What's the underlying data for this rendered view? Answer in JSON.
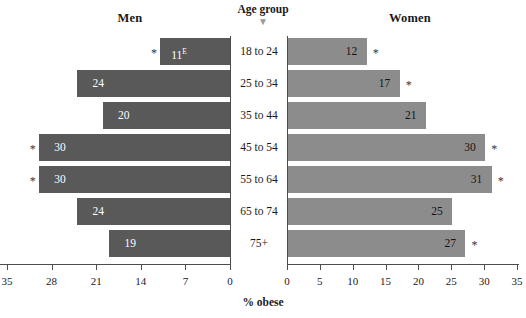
{
  "chart_data": {
    "type": "bar",
    "subtype": "population-pyramid",
    "title": "",
    "xlabel": "% obese",
    "ylabel": "Age group",
    "categories": [
      "18 to 24",
      "25 to 34",
      "35 to 44",
      "45 to 54",
      "55 to 64",
      "65 to 74",
      "75+"
    ],
    "series": [
      {
        "name": "Men",
        "side": "left",
        "color": "#595959",
        "values": [
          11,
          24,
          20,
          30,
          30,
          24,
          19
        ],
        "labels": [
          "11",
          "24",
          "20",
          "30",
          "30",
          "24",
          "19"
        ],
        "label_superscripts": [
          "E",
          "",
          "",
          "",
          "",
          "",
          ""
        ],
        "significance_marks": [
          "*",
          "",
          "",
          "*",
          "*",
          "",
          ""
        ],
        "axis": {
          "min": 0,
          "max": 35,
          "reversed": true,
          "ticks": [
            35,
            28,
            21,
            14,
            7,
            0
          ]
        }
      },
      {
        "name": "Women",
        "side": "right",
        "color": "#8c8c8c",
        "values": [
          12,
          17,
          21,
          30,
          31,
          25,
          27
        ],
        "labels": [
          "12",
          "17",
          "21",
          "30",
          "31",
          "25",
          "27"
        ],
        "label_superscripts": [
          "",
          "",
          "",
          "",
          "",
          "",
          ""
        ],
        "significance_marks": [
          "*",
          "*",
          "",
          "*",
          "*",
          "",
          "*"
        ],
        "axis": {
          "min": 0,
          "max": 35,
          "reversed": false,
          "ticks": [
            0,
            5,
            10,
            15,
            20,
            25,
            30,
            35
          ]
        }
      }
    ],
    "grid": false,
    "legend": "none"
  },
  "headers": {
    "men": "Men",
    "women": "Women",
    "age_group": "Age group",
    "age_group_caret": "▼"
  },
  "axis": {
    "caption": "% obese",
    "left_ticks": [
      "35",
      "28",
      "21",
      "14",
      "7",
      "0"
    ],
    "right_ticks": [
      "0",
      "5",
      "10",
      "15",
      "20",
      "25",
      "30",
      "35"
    ]
  },
  "ages": [
    "18 to 24",
    "25 to 34",
    "35 to 44",
    "45 to 54",
    "55 to 64",
    "65 to 74",
    "75+"
  ],
  "men_rows": [
    {
      "label": "11",
      "sup": "E",
      "star": "*"
    },
    {
      "label": "24",
      "sup": "",
      "star": ""
    },
    {
      "label": "20",
      "sup": "",
      "star": ""
    },
    {
      "label": "30",
      "sup": "",
      "star": "*"
    },
    {
      "label": "30",
      "sup": "",
      "star": "*"
    },
    {
      "label": "24",
      "sup": "",
      "star": ""
    },
    {
      "label": "19",
      "sup": "",
      "star": ""
    }
  ],
  "women_rows": [
    {
      "label": "12",
      "sup": "",
      "star": "*"
    },
    {
      "label": "17",
      "sup": "",
      "star": "*"
    },
    {
      "label": "21",
      "sup": "",
      "star": ""
    },
    {
      "label": "30",
      "sup": "",
      "star": "*"
    },
    {
      "label": "31",
      "sup": "",
      "star": "*"
    },
    {
      "label": "25",
      "sup": "",
      "star": ""
    },
    {
      "label": "27",
      "sup": "",
      "star": "*"
    }
  ],
  "colors": {
    "men_bar": "#595959",
    "women_bar": "#8c8c8c",
    "axis": "#4d4d4d",
    "background": "#ffffff"
  }
}
